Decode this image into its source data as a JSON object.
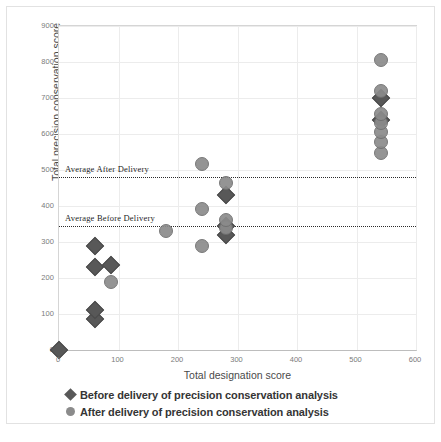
{
  "chart_data": {
    "type": "scatter",
    "title": "",
    "xlabel": "Total designation score",
    "ylabel": "Total precision conservation score",
    "xlim": [
      0,
      600
    ],
    "ylim": [
      0,
      900
    ],
    "xticks": [
      0,
      100,
      200,
      300,
      400,
      500,
      600
    ],
    "yticks": [
      0,
      100,
      200,
      300,
      400,
      500,
      600,
      700,
      800,
      900
    ],
    "grid": true,
    "legend_position": "bottom",
    "series": [
      {
        "name": "Before delivery of precision conservation analysis",
        "marker": "diamond",
        "color": "#585858",
        "points": [
          {
            "x": 0,
            "y": 0
          },
          {
            "x": 60,
            "y": 85
          },
          {
            "x": 60,
            "y": 110
          },
          {
            "x": 60,
            "y": 230
          },
          {
            "x": 60,
            "y": 290
          },
          {
            "x": 88,
            "y": 237
          },
          {
            "x": 281,
            "y": 320
          },
          {
            "x": 281,
            "y": 345
          },
          {
            "x": 281,
            "y": 430
          },
          {
            "x": 541,
            "y": 640
          },
          {
            "x": 541,
            "y": 700
          }
        ]
      },
      {
        "name": "After delivery of precision conservation analysis",
        "marker": "circle",
        "color": "#8b8b8b",
        "points": [
          {
            "x": 88,
            "y": 188
          },
          {
            "x": 180,
            "y": 330
          },
          {
            "x": 240,
            "y": 290
          },
          {
            "x": 240,
            "y": 392
          },
          {
            "x": 240,
            "y": 518
          },
          {
            "x": 281,
            "y": 340
          },
          {
            "x": 281,
            "y": 360
          },
          {
            "x": 281,
            "y": 465
          },
          {
            "x": 541,
            "y": 548
          },
          {
            "x": 541,
            "y": 578
          },
          {
            "x": 541,
            "y": 605
          },
          {
            "x": 541,
            "y": 630
          },
          {
            "x": 541,
            "y": 655
          },
          {
            "x": 541,
            "y": 720
          },
          {
            "x": 541,
            "y": 805
          }
        ]
      }
    ],
    "reference_lines": [
      {
        "label": "Average After Delivery",
        "value": 480
      },
      {
        "label": "Average Before Delivery",
        "value": 345
      }
    ]
  },
  "legend": {
    "items": [
      {
        "label": "Before delivery of precision conservation analysis",
        "marker": "diamond"
      },
      {
        "label": "After delivery of precision conservation analysis",
        "marker": "circle"
      }
    ]
  }
}
